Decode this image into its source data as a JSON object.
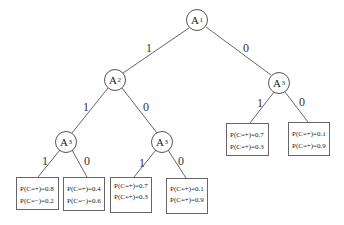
{
  "tree": {
    "nodes": {
      "root": {
        "label": "A",
        "sub": "1"
      },
      "a2": {
        "label": "A",
        "sub": "2"
      },
      "a3_right": {
        "label": "A",
        "sub": "3"
      },
      "a3_left": {
        "label": "A",
        "sub": "3"
      },
      "a3_mid": {
        "label": "A",
        "sub": "3"
      }
    },
    "edges": {
      "root_a2": "1",
      "root_a3_right": "0",
      "a2_a3_left": "1",
      "a2_a3_mid": "0",
      "a3_right_leaf1": "1",
      "a3_right_leaf0": "0",
      "a3_left_leaf1": "1",
      "a3_left_leaf0": "0",
      "a3_mid_leaf1": "1",
      "a3_mid_leaf0": "0"
    },
    "leaves": [
      {
        "line1": "P(C=+)=0.8",
        "line2": "P(C=−)=0.2"
      },
      {
        "line1": "P(C=+)=0.4",
        "line2": "P(C=−)=0.6"
      },
      {
        "line1": "P(C=+)=0.7",
        "line2": "P(C=+)=0.3"
      },
      {
        "line1": "P(C=+)=0.1",
        "line2": "P(C=+)=0.9"
      },
      {
        "line1": "P(C=+)=0.7",
        "line2": "P(C=+)=0.3"
      },
      {
        "line1": "P(C=+)=0.1",
        "line2": "P(C=+)=0.9"
      }
    ]
  }
}
